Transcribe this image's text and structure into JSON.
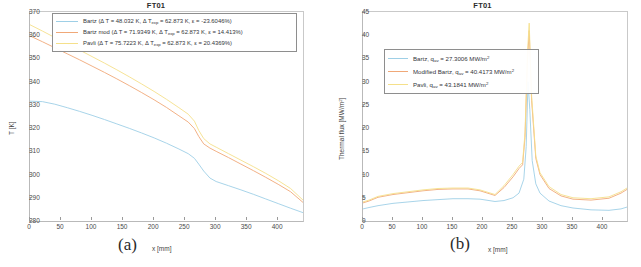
{
  "figure": {
    "panels": [
      {
        "letter": "(a)",
        "title": "FT01",
        "xlabel": "x [mm]",
        "ylabel": "T [K]"
      },
      {
        "letter": "(b)",
        "title": "FT01",
        "xlabel": "x [mm]",
        "ylabel_pre": "Thermal flux [MW/m",
        "ylabel_sup": "2",
        "ylabel_post": "]"
      }
    ]
  },
  "colors": {
    "bartz": "#9ecfe6",
    "bartz_mod": "#f0a878",
    "pavli": "#f5e08a",
    "axis": "#b9b9b9",
    "text": "#3b3b3b"
  },
  "legend_a": {
    "rows": [
      {
        "name": "Bartz",
        "pre": "Bartz (Δ T = 48.032 K, Δ T",
        "sub": "exp",
        "post": " = 62.873 K, ε = -23.6046%)",
        "color": "#9ecfe6",
        "dT": 48.032,
        "dT_exp": 62.873,
        "epsilon": -23.6046
      },
      {
        "name": "Bartz mod",
        "pre": "Bartz mod (Δ T = 71.9349 K, Δ T",
        "sub": "exp",
        "post": " = 62.873 K, ε = 14.413%)",
        "color": "#f0a878",
        "dT": 71.9349,
        "dT_exp": 62.873,
        "epsilon": 14.413
      },
      {
        "name": "Pavli",
        "pre": "Pavli (Δ T = 75.7223 K, Δ T",
        "sub": "exp",
        "post": " = 62.873 K, ε = 20.4369%)",
        "color": "#f5e08a",
        "dT": 75.7223,
        "dT_exp": 62.873,
        "epsilon": 20.4369
      }
    ]
  },
  "legend_b": {
    "rows": [
      {
        "name": "Bartz",
        "pre": "Bartz, q",
        "sub": "av",
        "mid": " = 27.3006 MW/m",
        "sup": "2",
        "color": "#9ecfe6",
        "q_av": 27.3006
      },
      {
        "name": "Modified Bartz",
        "pre": "Modified Bartz, q",
        "sub": "av",
        "mid": " = 40.4173 MW/m",
        "sup": "2",
        "color": "#f0a878",
        "q_av": 40.4173
      },
      {
        "name": "Pavli",
        "pre": "Pavli, q",
        "sub": "av",
        "mid": " = 43.1841 MW/m",
        "sup": "2",
        "color": "#f5e08a",
        "q_av": 43.1841
      }
    ]
  },
  "chart_data": [
    {
      "type": "line",
      "title": "FT01",
      "xlabel": "x [mm]",
      "ylabel": "T [K]",
      "xlim": [
        0,
        440
      ],
      "ylim": [
        280,
        370
      ],
      "xticks": [
        0,
        50,
        100,
        150,
        200,
        250,
        300,
        350,
        400
      ],
      "yticks": [
        280,
        290,
        300,
        310,
        320,
        330,
        340,
        350,
        360,
        370
      ],
      "grid": false,
      "legend_position": "top-center",
      "series": [
        {
          "name": "Bartz",
          "color": "#9ecfe6",
          "x": [
            0,
            20,
            40,
            60,
            80,
            100,
            120,
            140,
            160,
            180,
            200,
            220,
            240,
            255,
            265,
            272,
            280,
            290,
            300,
            320,
            340,
            360,
            380,
            400,
            420,
            440
          ],
          "y": [
            331.6,
            331.4,
            330.3,
            328.8,
            327.2,
            325.5,
            323.7,
            321.8,
            319.9,
            317.9,
            315.8,
            313.5,
            311.0,
            309.0,
            307.0,
            304.5,
            301.5,
            298.5,
            297.0,
            295.2,
            293.4,
            291.5,
            289.5,
            287.5,
            285.5,
            283.6
          ]
        },
        {
          "name": "Bartz mod",
          "color": "#f0a878",
          "x": [
            0,
            20,
            40,
            60,
            80,
            100,
            120,
            140,
            160,
            180,
            200,
            220,
            240,
            255,
            265,
            272,
            280,
            290,
            300,
            320,
            340,
            360,
            380,
            400,
            420,
            440
          ],
          "y": [
            359.7,
            357.2,
            354.6,
            352.0,
            349.4,
            346.7,
            344.0,
            341.2,
            338.3,
            335.3,
            332.2,
            328.9,
            325.3,
            322.6,
            319.8,
            316.4,
            313.2,
            311.4,
            310.0,
            307.3,
            304.5,
            301.7,
            298.8,
            295.8,
            292.6,
            288.0
          ]
        },
        {
          "name": "Pavli",
          "color": "#f5e08a",
          "x": [
            0,
            20,
            40,
            60,
            80,
            100,
            120,
            140,
            160,
            180,
            200,
            220,
            240,
            255,
            265,
            272,
            280,
            290,
            300,
            320,
            340,
            360,
            380,
            400,
            420,
            440
          ],
          "y": [
            364.5,
            361.8,
            359.0,
            356.3,
            353.6,
            350.8,
            348.0,
            345.1,
            342.1,
            339.0,
            335.8,
            332.4,
            328.8,
            326.0,
            323.0,
            319.0,
            315.5,
            313.2,
            311.8,
            309.0,
            306.2,
            303.4,
            300.5,
            297.4,
            294.0,
            289.0
          ]
        }
      ]
    },
    {
      "type": "line",
      "title": "FT01",
      "xlabel": "x [mm]",
      "ylabel": "Thermal flux [MW/m2]",
      "xlim": [
        0,
        440
      ],
      "ylim": [
        0,
        45
      ],
      "xticks": [
        0,
        50,
        100,
        150,
        200,
        250,
        300,
        350,
        400
      ],
      "yticks": [
        0,
        5,
        10,
        15,
        20,
        25,
        30,
        35,
        40,
        45
      ],
      "grid": false,
      "legend_position": "upper-left",
      "series": [
        {
          "name": "Bartz",
          "color": "#9ecfe6",
          "x": [
            0,
            10,
            25,
            50,
            75,
            100,
            125,
            150,
            175,
            195,
            210,
            220,
            235,
            250,
            260,
            268,
            272,
            275,
            278,
            282,
            288,
            295,
            310,
            330,
            350,
            380,
            410,
            430,
            440
          ],
          "y": [
            2.6,
            2.9,
            3.3,
            3.8,
            4.1,
            4.4,
            4.6,
            4.8,
            4.8,
            4.7,
            4.4,
            4.2,
            4.4,
            5.0,
            6.0,
            9.0,
            16.0,
            30.0,
            24.0,
            13.0,
            8.0,
            6.0,
            4.3,
            3.3,
            2.8,
            2.4,
            2.3,
            2.6,
            3.0
          ]
        },
        {
          "name": "Modified Bartz",
          "color": "#f0a878",
          "x": [
            0,
            10,
            25,
            50,
            75,
            100,
            125,
            150,
            175,
            195,
            210,
            220,
            235,
            250,
            260,
            266,
            270,
            274,
            277,
            281,
            288,
            295,
            310,
            330,
            350,
            380,
            410,
            430,
            440
          ],
          "y": [
            3.9,
            4.3,
            5.1,
            5.7,
            6.1,
            6.5,
            6.8,
            6.9,
            6.9,
            6.5,
            5.9,
            5.5,
            7.2,
            9.5,
            11.3,
            12.1,
            18.0,
            34.0,
            41.0,
            26.0,
            13.5,
            10.0,
            7.0,
            5.4,
            4.7,
            4.5,
            4.9,
            6.0,
            6.8
          ]
        },
        {
          "name": "Pavli",
          "color": "#f5e08a",
          "x": [
            0,
            10,
            25,
            50,
            75,
            100,
            125,
            150,
            175,
            195,
            210,
            220,
            235,
            250,
            260,
            266,
            270,
            274,
            277,
            281,
            288,
            295,
            310,
            330,
            350,
            380,
            410,
            430,
            440
          ],
          "y": [
            4.1,
            4.5,
            5.3,
            5.9,
            6.3,
            6.7,
            7.0,
            7.1,
            7.1,
            6.7,
            6.1,
            5.7,
            7.6,
            10.0,
            11.8,
            12.6,
            19.0,
            36.0,
            42.6,
            27.0,
            14.0,
            10.4,
            7.4,
            5.7,
            5.0,
            4.8,
            5.2,
            6.3,
            7.1
          ]
        }
      ]
    }
  ]
}
